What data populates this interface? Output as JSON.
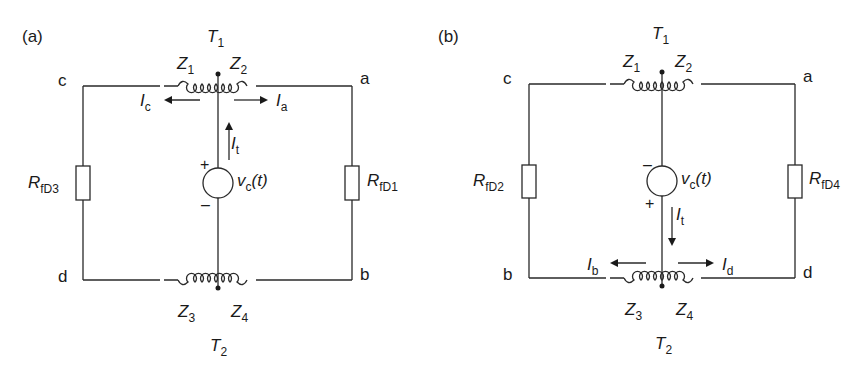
{
  "figure": {
    "panels": [
      {
        "id": "a",
        "label": "(a)",
        "transformer_top": {
          "name": "T",
          "sub": "1"
        },
        "transformer_bottom": {
          "name": "T",
          "sub": "2"
        },
        "windings": [
          {
            "name": "Z",
            "sub": "1"
          },
          {
            "name": "Z",
            "sub": "2"
          },
          {
            "name": "Z",
            "sub": "3"
          },
          {
            "name": "Z",
            "sub": "4"
          }
        ],
        "nodes": {
          "top_left": "c",
          "top_right": "a",
          "bottom_left": "d",
          "bottom_right": "b"
        },
        "resistors": {
          "left": {
            "name": "R",
            "sub": "fD3"
          },
          "right": {
            "name": "R",
            "sub": "fD1"
          }
        },
        "source": {
          "name": "v",
          "sub": "c",
          "arg": "(t)",
          "top_polarity": "+",
          "bottom_polarity": "–"
        },
        "currents": {
          "left": {
            "name": "I",
            "sub": "c"
          },
          "right": {
            "name": "I",
            "sub": "a"
          },
          "vertical": {
            "name": "I",
            "sub": "t",
            "direction": "up"
          }
        }
      },
      {
        "id": "b",
        "label": "(b)",
        "transformer_top": {
          "name": "T",
          "sub": "1"
        },
        "transformer_bottom": {
          "name": "T",
          "sub": "2"
        },
        "windings": [
          {
            "name": "Z",
            "sub": "1"
          },
          {
            "name": "Z",
            "sub": "2"
          },
          {
            "name": "Z",
            "sub": "3"
          },
          {
            "name": "Z",
            "sub": "4"
          }
        ],
        "nodes": {
          "top_left": "c",
          "top_right": "a",
          "bottom_left": "b",
          "bottom_right": "d"
        },
        "resistors": {
          "left": {
            "name": "R",
            "sub": "fD2"
          },
          "right": {
            "name": "R",
            "sub": "fD4"
          }
        },
        "source": {
          "name": "v",
          "sub": "c",
          "arg": "(t)",
          "top_polarity": "–",
          "bottom_polarity": "+"
        },
        "currents": {
          "left": {
            "name": "I",
            "sub": "b"
          },
          "right": {
            "name": "I",
            "sub": "d"
          },
          "vertical": {
            "name": "I",
            "sub": "t",
            "direction": "down"
          }
        }
      }
    ],
    "colors": {
      "line": "#2a2a2a",
      "background": "#ffffff"
    }
  }
}
